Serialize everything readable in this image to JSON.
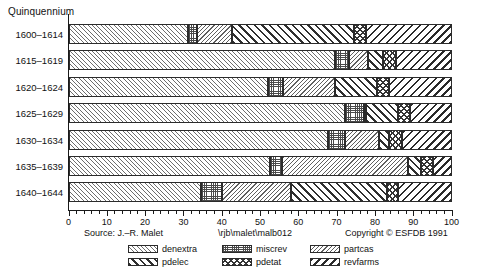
{
  "chart_data": {
    "type": "bar",
    "orientation": "horizontal",
    "stacked": true,
    "normalized": true,
    "title": "",
    "ylabel": "Quinquennium",
    "xlabel": "",
    "xlim": [
      0,
      100
    ],
    "xticks": [
      0,
      10,
      20,
      30,
      40,
      50,
      60,
      70,
      80,
      90,
      100
    ],
    "grid": false,
    "legend_position": "bottom",
    "categories": [
      "1600–1614",
      "1615–1619",
      "1620–1624",
      "1625–1629",
      "1630–1634",
      "1635–1639",
      "1640–1644"
    ],
    "series": [
      {
        "name": "denextra",
        "pattern": "fine-forward-hatch",
        "values": [
          31.0,
          69.5,
          52.0,
          72.0,
          67.5,
          52.5,
          34.5
        ]
      },
      {
        "name": "miscrev",
        "pattern": "dotted-stipple",
        "values": [
          2.5,
          3.5,
          4.0,
          5.0,
          4.5,
          3.0,
          5.5
        ]
      },
      {
        "name": "partcas",
        "pattern": "fine-back-hatch",
        "values": [
          9.0,
          5.0,
          13.5,
          0.5,
          9.0,
          33.0,
          18.0
        ]
      },
      {
        "name": "pdelec",
        "pattern": "bold-forward-hatch",
        "values": [
          32.0,
          4.0,
          11.0,
          8.5,
          2.5,
          3.5,
          25.0
        ]
      },
      {
        "name": "pdetat",
        "pattern": "cross-hatch",
        "values": [
          3.0,
          3.5,
          3.0,
          3.0,
          3.5,
          3.0,
          3.0
        ]
      },
      {
        "name": "revfarms",
        "pattern": "bold-back-hatch",
        "values": [
          22.5,
          14.5,
          16.5,
          11.0,
          13.0,
          5.0,
          14.0
        ]
      }
    ]
  },
  "chart": {
    "axis_title": "Quinquennium",
    "x_tick_labels": [
      "0",
      "10",
      "20",
      "30",
      "40",
      "50",
      "60",
      "70",
      "80",
      "90",
      "100"
    ],
    "category_labels": [
      "1600–1614",
      "1615–1619",
      "1620–1624",
      "1625–1629",
      "1630–1634",
      "1635–1639",
      "1640–1644"
    ]
  },
  "footer": {
    "source": "Source: J.–R. Malet",
    "path": "\\rjb\\malet\\malb012",
    "copyright": "Copyright © ESFDB 1991",
    "legend": [
      {
        "label": "denextra",
        "pattern": "fine-forward-hatch"
      },
      {
        "label": "miscrev",
        "pattern": "dotted-stipple"
      },
      {
        "label": "partcas",
        "pattern": "fine-back-hatch"
      },
      {
        "label": "pdelec",
        "pattern": "bold-forward-hatch"
      },
      {
        "label": "pdetat",
        "pattern": "cross-hatch"
      },
      {
        "label": "revfarms",
        "pattern": "bold-back-hatch"
      }
    ]
  },
  "colors": {
    "ink": "#1a1a1a",
    "background": "#ffffff",
    "hatch": "#2f2f2f"
  }
}
